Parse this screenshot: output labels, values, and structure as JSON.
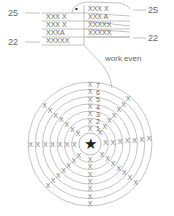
{
  "top_chart": {
    "left_labels": [
      "25",
      "22"
    ],
    "right_labels": [
      "25",
      "22"
    ],
    "rows": [
      {
        "left": "XXX X",
        "right": "XXX X"
      },
      {
        "left": "XXX X",
        "right": "XXX A"
      },
      {
        "left": "XXXA",
        "right": "XXXXX"
      },
      {
        "left": "XXXXX",
        "right": "XXXXX"
      }
    ],
    "mark_symbol": "•",
    "note": "work even"
  },
  "round_chart": {
    "center_symbol": "★",
    "round_numbers": [
      "7",
      "6",
      "5",
      "4",
      "3",
      "2",
      "1"
    ],
    "rounds": 7,
    "stitch_symbol": "X",
    "line_color": "#9a9a9a",
    "ink_color": "#222222"
  }
}
